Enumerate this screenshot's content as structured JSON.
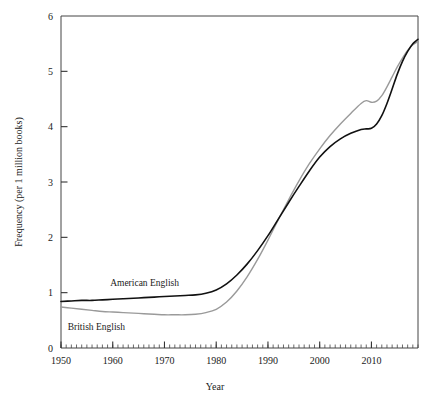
{
  "chart_data": {
    "type": "line",
    "title": "",
    "xlabel": "Year",
    "ylabel": "Frequency (per 1 million books)",
    "xlim": [
      1950,
      2019
    ],
    "ylim": [
      0,
      6
    ],
    "xticks": [
      1950,
      1960,
      1970,
      1980,
      1990,
      2000,
      2010
    ],
    "xtick_labels": [
      "1950",
      "1960",
      "1970",
      "1980",
      "1990",
      "2000",
      "2010"
    ],
    "minor_xtick_interval": 1,
    "yticks": [
      0,
      1,
      2,
      3,
      4,
      5,
      6
    ],
    "ytick_labels": [
      "0",
      "1",
      "2",
      "3",
      "4",
      "5",
      "6"
    ],
    "grid": false,
    "legend": "inline-annotation",
    "series": [
      {
        "name": "American English",
        "color": "#111111",
        "line_width": 1.6,
        "label_x": 1959.5,
        "label_y": 1.12,
        "x": [
          1950,
          1952,
          1954,
          1956,
          1958,
          1960,
          1962,
          1964,
          1966,
          1968,
          1970,
          1972,
          1974,
          1976,
          1978,
          1980,
          1982,
          1984,
          1986,
          1988,
          1990,
          1992,
          1994,
          1996,
          1998,
          2000,
          2002,
          2004,
          2006,
          2008,
          2009,
          2010,
          2011,
          2012,
          2013,
          2014,
          2015,
          2016,
          2017,
          2018,
          2019
        ],
        "values": [
          0.84,
          0.85,
          0.86,
          0.86,
          0.87,
          0.88,
          0.89,
          0.9,
          0.91,
          0.92,
          0.93,
          0.94,
          0.95,
          0.96,
          0.99,
          1.05,
          1.16,
          1.32,
          1.52,
          1.76,
          2.03,
          2.33,
          2.63,
          2.92,
          3.2,
          3.45,
          3.64,
          3.78,
          3.88,
          3.95,
          3.96,
          3.97,
          4.05,
          4.2,
          4.42,
          4.68,
          4.95,
          5.18,
          5.36,
          5.5,
          5.58
        ]
      },
      {
        "name": "British English",
        "color": "#9a9a9a",
        "line_width": 1.4,
        "label_x": 1951.3,
        "label_y": 0.33,
        "x": [
          1950,
          1952,
          1954,
          1956,
          1958,
          1960,
          1962,
          1964,
          1966,
          1968,
          1970,
          1972,
          1974,
          1976,
          1978,
          1980,
          1982,
          1984,
          1986,
          1988,
          1990,
          1992,
          1994,
          1996,
          1998,
          2000,
          2002,
          2004,
          2006,
          2008,
          2009,
          2010,
          2011,
          2012,
          2013,
          2014,
          2015,
          2016,
          2017,
          2018,
          2019
        ],
        "values": [
          0.74,
          0.72,
          0.7,
          0.68,
          0.66,
          0.65,
          0.64,
          0.63,
          0.62,
          0.61,
          0.6,
          0.6,
          0.6,
          0.61,
          0.64,
          0.7,
          0.83,
          1.03,
          1.29,
          1.6,
          1.95,
          2.32,
          2.68,
          3.02,
          3.33,
          3.6,
          3.84,
          4.05,
          4.24,
          4.42,
          4.47,
          4.44,
          4.46,
          4.56,
          4.72,
          4.9,
          5.08,
          5.24,
          5.38,
          5.48,
          5.54
        ]
      }
    ]
  },
  "axes": {
    "y_axis_title": "Frequency (per 1 million books)",
    "x_axis_title": "Year"
  }
}
